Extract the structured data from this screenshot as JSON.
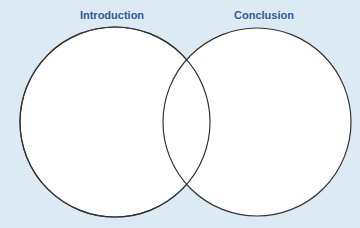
{
  "diagram": {
    "type": "venn",
    "background": "#dcebf3",
    "label_color": "#2f5a9a",
    "sets": [
      {
        "label": "Introduction",
        "cx": 115,
        "cy": 122,
        "r": 95
      },
      {
        "label": "Conclusion",
        "cx": 257,
        "cy": 122,
        "r": 94
      }
    ]
  }
}
